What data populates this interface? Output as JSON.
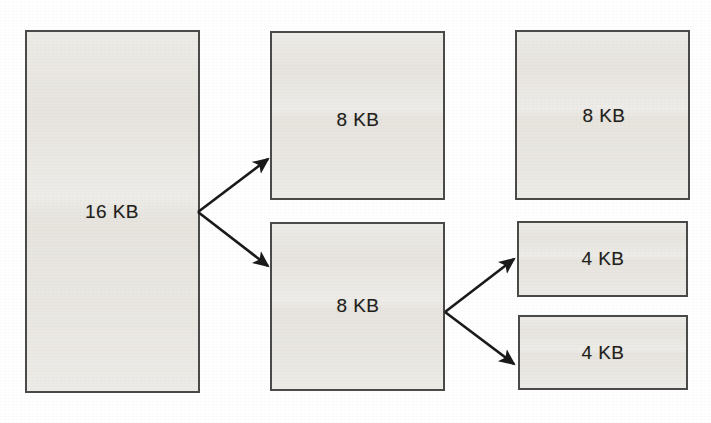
{
  "figure": {
    "name": "memory-block-splitting-diagram",
    "background_color": "#ffffff",
    "block_fill_color": "#e6e3dd",
    "block_border_color": "#4a4a48",
    "label_color": "#231f1c",
    "arrow_color": "#1a1a1a"
  },
  "blocks": [
    {
      "id": "block-16kb",
      "label": "16 KB",
      "x": 25,
      "y": 30,
      "w": 175,
      "h": 363,
      "label_x": 112,
      "label_y": 212
    },
    {
      "id": "block-8kb-top-middle",
      "label": "8 KB",
      "x": 270,
      "y": 31,
      "w": 175,
      "h": 169,
      "label_x": 358,
      "label_y": 120
    },
    {
      "id": "block-8kb-bottom-middle",
      "label": "8 KB",
      "x": 270,
      "y": 222,
      "w": 175,
      "h": 169,
      "label_x": 358,
      "label_y": 306
    },
    {
      "id": "block-8kb-right",
      "label": "8 KB",
      "x": 515,
      "y": 30,
      "w": 175,
      "h": 170,
      "label_x": 604,
      "label_y": 116
    },
    {
      "id": "block-4kb-upper-right",
      "label": "4 KB",
      "x": 517,
      "y": 221,
      "w": 171,
      "h": 76,
      "label_x": 603,
      "label_y": 259
    },
    {
      "id": "block-4kb-lower-right",
      "label": "4 KB",
      "x": 518,
      "y": 315,
      "w": 170,
      "h": 75,
      "label_x": 603,
      "label_y": 353
    }
  ],
  "arrows": [
    {
      "id": "arrow-16kb-to-8kb-top",
      "from_x": 198,
      "from_y": 212,
      "to_x": 268,
      "to_y": 159
    },
    {
      "id": "arrow-16kb-to-8kb-bottom",
      "from_x": 198,
      "from_y": 212,
      "to_x": 268,
      "to_y": 266
    },
    {
      "id": "arrow-8kb-to-4kb-upper",
      "from_x": 445,
      "from_y": 312,
      "to_x": 514,
      "to_y": 259
    },
    {
      "id": "arrow-8kb-to-4kb-lower",
      "from_x": 445,
      "from_y": 312,
      "to_x": 514,
      "to_y": 364
    }
  ]
}
